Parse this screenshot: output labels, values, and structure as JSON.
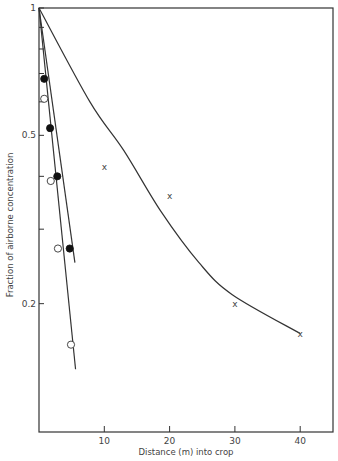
{
  "chart_data": {
    "type": "scatter",
    "title": "",
    "xlabel": "Distance (m) into crop",
    "ylabel": "Fraction of airborne concentration",
    "xlim": [
      0,
      45
    ],
    "ylim": [
      0.1,
      1
    ],
    "yscale": "log",
    "grid": false,
    "legend": null,
    "x_ticks": [
      10,
      20,
      30,
      40
    ],
    "x_tick_labels": [
      "10",
      "20",
      "30",
      "40"
    ],
    "y_ticks": [
      1,
      0.9,
      0.8,
      0.7,
      0.6,
      0.5,
      0.4,
      0.3,
      0.2
    ],
    "y_tick_labels": [
      {
        "value": 1,
        "label": "1"
      },
      {
        "value": 0.5,
        "label": "0.5"
      },
      {
        "value": 0.2,
        "label": "0.2"
      }
    ],
    "series": [
      {
        "name": "filled circles",
        "marker": "filled-circle",
        "x": [
          0.8,
          1.7,
          2.8,
          4.7
        ],
        "y": [
          0.68,
          0.52,
          0.4,
          0.27
        ],
        "fit_line": {
          "x": [
            0,
            5.5
          ],
          "y": [
            1,
            0.25
          ]
        }
      },
      {
        "name": "open circles",
        "marker": "open-circle",
        "x": [
          0.8,
          1.8,
          2.9,
          4.9
        ],
        "y": [
          0.61,
          0.39,
          0.27,
          0.16
        ],
        "fit_line": {
          "x": [
            0,
            5.6
          ],
          "y": [
            1,
            0.14
          ]
        }
      },
      {
        "name": "crosses",
        "marker": "x",
        "x": [
          10,
          20,
          30,
          40
        ],
        "y": [
          0.42,
          0.36,
          0.2,
          0.17
        ],
        "fit_curve": {
          "x": [
            0,
            7.8,
            13,
            18.7,
            24.5,
            29.6,
            40
          ],
          "y": [
            1,
            0.6,
            0.46,
            0.33,
            0.25,
            0.21,
            0.17
          ]
        }
      }
    ]
  }
}
